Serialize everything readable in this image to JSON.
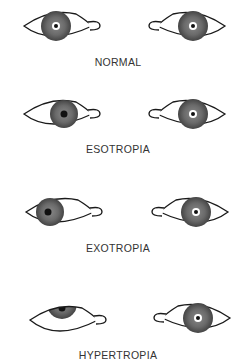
{
  "diagram": {
    "rows": [
      {
        "label": "NORMAL",
        "left_eye": {
          "iris_dx": 0,
          "iris_dy": 0
        },
        "right_eye": {
          "iris_dx": 0,
          "iris_dy": 0
        }
      },
      {
        "label": "ESOTROPIA",
        "left_eye": {
          "iris_dx": 6,
          "iris_dy": 0
        },
        "right_eye": {
          "iris_dx": 0,
          "iris_dy": 0
        }
      },
      {
        "label": "EXOTROPIA",
        "left_eye": {
          "iris_dx": -6,
          "iris_dy": 0
        },
        "right_eye": {
          "iris_dx": 0,
          "iris_dy": 0
        }
      },
      {
        "label": "HYPERTROPIA",
        "left_eye": {
          "iris_dx": 0,
          "iris_dy": -8
        },
        "right_eye": {
          "iris_dx": 0,
          "iris_dy": 0
        }
      }
    ],
    "colors": {
      "outline": "#1a1a1a",
      "iris_dark": "#555555",
      "iris_light": "#bbbbbb",
      "text": "#333333"
    }
  }
}
